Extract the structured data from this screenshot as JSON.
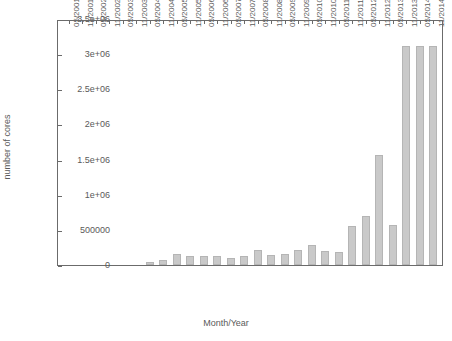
{
  "chart_data": {
    "type": "bar",
    "title": "",
    "xlabel": "Month/Year",
    "ylabel": "number of cores",
    "ylim": [
      0,
      3500000
    ],
    "ytick_labels": [
      "0",
      "500000",
      "1e+06",
      "1.5e+06",
      "2e+06",
      "2.5e+06",
      "3e+06",
      "3.5e+06"
    ],
    "ytick_values": [
      0,
      500000,
      1000000,
      1500000,
      2000000,
      2500000,
      3000000,
      3500000
    ],
    "grid": false,
    "legend": "none",
    "bar_color": "#c9c9c9",
    "bar_edge_color": "#b5b5b5",
    "axis_color": "#6b6b6b",
    "categories": [
      "05/2001",
      "11/2001",
      "05/2002",
      "11/2002",
      "05/2003",
      "11/2003",
      "05/2004",
      "11/2004",
      "05/2005",
      "11/2005",
      "05/2006",
      "11/2006",
      "05/2007",
      "11/2007",
      "05/2008",
      "11/2008",
      "05/2009",
      "11/2009",
      "05/2010",
      "11/2010",
      "05/2011",
      "11/2011",
      "05/2012",
      "11/2012",
      "05/2013",
      "11/2013",
      "05/2014",
      "11/2014"
    ],
    "values": [
      0,
      0,
      0,
      0,
      0,
      0,
      45000,
      75000,
      150000,
      130000,
      130000,
      135000,
      100000,
      130000,
      215000,
      145000,
      150000,
      220000,
      290000,
      195000,
      185000,
      550000,
      700000,
      1570000,
      565000,
      3120000,
      3120000,
      3120000
    ]
  },
  "axis": {
    "y_min_label": "0",
    "y_max_label": "3.5e+06"
  }
}
